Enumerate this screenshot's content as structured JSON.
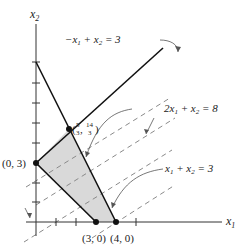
{
  "diagram": {
    "type": "linear-programming-feasible-region",
    "axes": {
      "x_label": "x",
      "x_sub": "1",
      "y_label": "x",
      "y_sub": "2"
    },
    "constraints": [
      {
        "id": "c1",
        "label_parts": [
          "−x",
          "1",
          " + x",
          "2",
          " = 3"
        ],
        "equation": "-x1 + x2 = 3"
      },
      {
        "id": "c2",
        "label_parts": [
          "2x",
          "1",
          " + x",
          "2",
          " = 8"
        ],
        "equation": "2x1 + x2 = 8"
      },
      {
        "id": "obj",
        "label_parts": [
          "x",
          "1",
          " + x",
          "2",
          " = 3"
        ],
        "equation": "x1 + x2 = 3"
      }
    ],
    "vertices": [
      {
        "id": "v03",
        "label": "(0, 3)",
        "x1": 0,
        "x2": 3
      },
      {
        "id": "v53",
        "label_num1": "5",
        "label_den1": "3",
        "label_num2": "14",
        "label_den2": "3",
        "x1": 1.667,
        "x2": 4.667
      },
      {
        "id": "v30",
        "label": "(3, 0)",
        "x1": 3,
        "x2": 0
      },
      {
        "id": "v40",
        "label": "(4, 0)",
        "x1": 4,
        "x2": 0
      }
    ],
    "colors": {
      "region_fill": "#d9d9d9",
      "line": "#111111",
      "dashed": "#888888"
    }
  }
}
